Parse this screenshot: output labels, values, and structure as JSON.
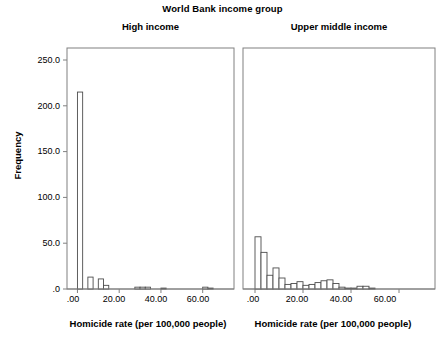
{
  "chart_data": {
    "type": "bar",
    "title": "World Bank income group",
    "ylabel": "Frequency",
    "xlabel": "Homicide rate (per 100,000 people)",
    "ylim": [
      0,
      275
    ],
    "xlim": [
      -5,
      75
    ],
    "yticks": [
      0.0,
      50.0,
      100.0,
      150.0,
      200.0,
      250.0
    ],
    "ytick_labels": [
      ".0",
      "50.0",
      "100.0",
      "150.0",
      "200.0",
      "250.0"
    ],
    "xticks": [
      0,
      20,
      40,
      60
    ],
    "xtick_labels": [
      ".00",
      "20.00",
      "40.00",
      "60.00"
    ],
    "grid": false,
    "legend": false,
    "bin_width": 2.5,
    "panels": [
      {
        "name": "High income",
        "bins": [
          0,
          2.5,
          5,
          7.5,
          10,
          12.5,
          15,
          17.5,
          20,
          22.5,
          25,
          27.5,
          30,
          32.5,
          35,
          37.5,
          40,
          42.5,
          45,
          47.5,
          50,
          52.5,
          55,
          57.5,
          60,
          62.5,
          65
        ],
        "values": [
          215,
          0,
          13,
          0,
          11,
          4,
          0,
          0,
          0,
          0,
          0,
          2,
          2,
          2,
          0,
          0,
          1,
          0,
          0,
          0,
          0,
          0,
          0,
          0,
          2,
          1,
          0
        ]
      },
      {
        "name": "Upper middle income",
        "bins": [
          0,
          2.5,
          5,
          7.5,
          10,
          12.5,
          15,
          17.5,
          20,
          22.5,
          25,
          27.5,
          30,
          32.5,
          35,
          37.5,
          40,
          42.5,
          45,
          47.5,
          50,
          52.5,
          55,
          57.5,
          60
        ],
        "values": [
          57,
          40,
          15,
          23,
          12,
          5,
          6,
          8,
          4,
          5,
          7,
          9,
          10,
          6,
          2,
          1,
          1,
          3,
          3,
          1,
          0,
          0,
          0,
          0,
          0
        ]
      }
    ]
  },
  "axis": {
    "ytick_0": ".0",
    "ytick_50": "50.0",
    "ytick_100": "100.0",
    "ytick_150": "150.0",
    "ytick_200": "200.0",
    "ytick_250": "250.0",
    "xtick_0": ".00",
    "xtick_20": "20.00",
    "xtick_40": "40.00",
    "xtick_60": "60.00"
  },
  "colors": {
    "bar_fill": "#ffffff",
    "bar_stroke": "#4d4d4d",
    "axis": "#808080",
    "text": "#000000",
    "background": "#ffffff"
  }
}
